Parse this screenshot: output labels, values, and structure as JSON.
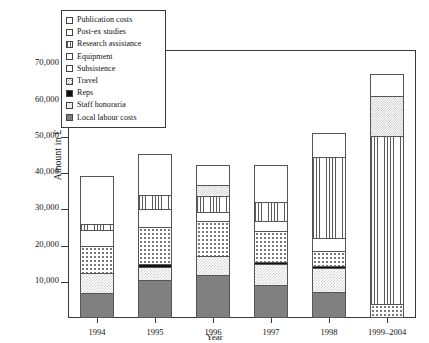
{
  "chart_data": {
    "type": "bar",
    "subtype": "stacked-bar",
    "title": "",
    "xlabel": "Year",
    "ylabel": "Amount in £",
    "categories": [
      "1994",
      "1995",
      "1996",
      "1997",
      "1998",
      "1999–2004"
    ],
    "ylim": [
      0,
      74000
    ],
    "yticks": [
      10000,
      20000,
      30000,
      40000,
      50000,
      60000,
      70000
    ],
    "ytick_labels": [
      "10,000",
      "20,000",
      "30,000",
      "40,000",
      "50,000",
      "60,000",
      "70,000"
    ],
    "grid": false,
    "legend_position": "top-left-inside",
    "series": [
      {
        "name": "Local labour costs",
        "pattern": "solid-gray",
        "values": [
          7000,
          10500,
          11800,
          9000,
          7300,
          0
        ]
      },
      {
        "name": "Staff honoraria",
        "pattern": "checker",
        "values": [
          5300,
          3700,
          5200,
          6000,
          6400,
          0
        ]
      },
      {
        "name": "Reps",
        "pattern": "solid-black",
        "values": [
          0,
          600,
          0,
          600,
          600,
          0
        ]
      },
      {
        "name": "Travel",
        "pattern": "dots-coarse",
        "values": [
          7700,
          10200,
          9800,
          8400,
          4300,
          3800
        ]
      },
      {
        "name": "Subsistence",
        "pattern": "dots-fine",
        "values": [
          0,
          0,
          0,
          0,
          0,
          0
        ]
      },
      {
        "name": "Equipment",
        "pattern": "white",
        "values": [
          4200,
          5000,
          2600,
          2900,
          3400,
          0
        ]
      },
      {
        "name": "Research assistance",
        "pattern": "vertical-lines",
        "values": [
          1700,
          4100,
          4400,
          5100,
          22500,
          46500
        ]
      },
      {
        "name": "Post-ex studies",
        "pattern": "checker-dense",
        "values": [
          0,
          0,
          3000,
          0,
          0,
          11000
        ]
      },
      {
        "name": "Publication costs",
        "pattern": "white",
        "values": [
          13300,
          11100,
          5400,
          10200,
          6500,
          6200
        ]
      }
    ],
    "totals": [
      39200,
      45200,
      42200,
      42200,
      51000,
      67500
    ]
  },
  "axis": {
    "y_title": "Amount in £",
    "x_title": "Year",
    "y_ticks": [
      {
        "value": 70000,
        "label": "70,000"
      },
      {
        "value": 60000,
        "label": "60,000"
      },
      {
        "value": 50000,
        "label": "50,000"
      },
      {
        "value": 40000,
        "label": "40,000"
      },
      {
        "value": 30000,
        "label": "30,000"
      },
      {
        "value": 20000,
        "label": "20,000"
      },
      {
        "value": 10000,
        "label": "10,000"
      }
    ],
    "x_ticks": [
      "1994",
      "1995",
      "1996",
      "1997",
      "1998",
      "1999–2004"
    ]
  },
  "legend": {
    "items": [
      {
        "label": "Publication costs",
        "pattern": "white"
      },
      {
        "label": "Post-ex studies",
        "pattern": "white"
      },
      {
        "label": "Research assistance",
        "pattern": "vertical-lines"
      },
      {
        "label": "Equipment",
        "pattern": "white"
      },
      {
        "label": "Subsistence",
        "pattern": "white"
      },
      {
        "label": "Travel",
        "pattern": "dots-fine"
      },
      {
        "label": "Reps",
        "pattern": "solid-black"
      },
      {
        "label": "Staff honoraria",
        "pattern": "checker"
      },
      {
        "label": "Local labour costs",
        "pattern": "solid-gray"
      }
    ]
  },
  "colors": {
    "axis": "#3a3a3a",
    "gray_fill": "#808080",
    "black_fill": "#111111",
    "background": "#ffffff"
  }
}
